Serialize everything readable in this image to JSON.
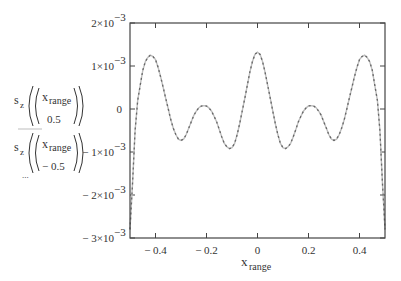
{
  "chart_data": {
    "type": "line",
    "title": "",
    "xlabel": "x",
    "xlabel_sub": "range",
    "ylabel": "",
    "xlim": [
      -0.5,
      0.5
    ],
    "ylim": [
      -0.003,
      0.002
    ],
    "grid": false,
    "x_ticks": [
      -0.4,
      -0.2,
      0,
      0.2,
      0.4
    ],
    "x_tick_labels": [
      "− 0.4",
      "− 0.2",
      "0",
      "0.2",
      "0.4"
    ],
    "y_ticks": [
      0.002,
      0.001,
      0,
      -0.001,
      -0.002,
      -0.003
    ],
    "y_tick_labels": [
      {
        "mant": "2×10",
        "exp": "−3"
      },
      {
        "mant": "1×10",
        "exp": "−3"
      },
      {
        "mant": "0",
        "exp": ""
      },
      {
        "mant": "− 1×10",
        "exp": "−3"
      },
      {
        "mant": "− 2×10",
        "exp": "−3"
      },
      {
        "mant": "− 3×10",
        "exp": "−3"
      }
    ],
    "legend": {
      "placement": "left",
      "entries": [
        {
          "fn": "s",
          "fn_sub": "z",
          "arg_top": "x",
          "arg_top_sub": "range",
          "arg_bottom": "0.5",
          "style": "solid",
          "color": "#bdbdbd"
        },
        {
          "fn": "s",
          "fn_sub": "z",
          "arg_top": "x",
          "arg_top_sub": "range",
          "arg_bottom": "− 0.5",
          "style": "dashed",
          "color": "#666666"
        }
      ],
      "ellipsis": "..."
    },
    "series": [
      {
        "name": "s_z(x_range, 0.5)",
        "style": "solid",
        "color": "#bdbdbd",
        "x": [
          -0.5,
          -0.49,
          -0.48,
          -0.47,
          -0.46,
          -0.45,
          -0.44,
          -0.43,
          -0.42,
          -0.41,
          -0.4,
          -0.39,
          -0.38,
          -0.37,
          -0.36,
          -0.35,
          -0.34,
          -0.33,
          -0.32,
          -0.31,
          -0.3,
          -0.29,
          -0.28,
          -0.27,
          -0.26,
          -0.25,
          -0.24,
          -0.23,
          -0.22,
          -0.21,
          -0.2,
          -0.19,
          -0.18,
          -0.17,
          -0.16,
          -0.15,
          -0.14,
          -0.13,
          -0.12,
          -0.11,
          -0.1,
          -0.09,
          -0.08,
          -0.07,
          -0.06,
          -0.05,
          -0.04,
          -0.03,
          -0.02,
          -0.01,
          0,
          0.01,
          0.02,
          0.03,
          0.04,
          0.05,
          0.06,
          0.07,
          0.08,
          0.09,
          0.1,
          0.11,
          0.12,
          0.13,
          0.14,
          0.15,
          0.16,
          0.17,
          0.18,
          0.19,
          0.2,
          0.21,
          0.22,
          0.23,
          0.24,
          0.25,
          0.26,
          0.27,
          0.28,
          0.29,
          0.3,
          0.31,
          0.32,
          0.33,
          0.34,
          0.35,
          0.36,
          0.37,
          0.38,
          0.39,
          0.4,
          0.41,
          0.42,
          0.43,
          0.44,
          0.45,
          0.46,
          0.47,
          0.48,
          0.49,
          0.5
        ],
        "y": [
          -0.0028,
          -0.0017,
          -0.0005,
          0.0002,
          0.00055,
          0.0009,
          0.0011,
          0.0012,
          0.00125,
          0.00122,
          0.00115,
          0.00097,
          0.00075,
          0.0005,
          0.00025,
          0.0,
          -0.00025,
          -0.00045,
          -0.0006,
          -0.0007,
          -0.00073,
          -0.0007,
          -0.0006,
          -0.00045,
          -0.0003,
          -0.00015,
          -5e-05,
          3e-05,
          7e-05,
          8e-05,
          7e-05,
          2e-05,
          -5e-05,
          -0.00017,
          -0.0003,
          -0.00048,
          -0.00065,
          -0.0008,
          -0.00088,
          -0.00092,
          -0.0009,
          -0.0008,
          -0.0006,
          -0.00035,
          -5e-05,
          0.00025,
          0.00055,
          0.00085,
          0.0011,
          0.00127,
          0.00132,
          0.00127,
          0.0011,
          0.00085,
          0.00055,
          0.00025,
          -5e-05,
          -0.00035,
          -0.0006,
          -0.0008,
          -0.0009,
          -0.00092,
          -0.00088,
          -0.0008,
          -0.00065,
          -0.00048,
          -0.0003,
          -0.00017,
          -5e-05,
          2e-05,
          7e-05,
          8e-05,
          7e-05,
          3e-05,
          -5e-05,
          -0.00015,
          -0.0003,
          -0.00045,
          -0.0006,
          -0.0007,
          -0.00073,
          -0.0007,
          -0.0006,
          -0.00045,
          -0.00025,
          0.0,
          0.00025,
          0.0005,
          0.00075,
          0.00097,
          0.00115,
          0.00122,
          0.00125,
          0.0012,
          0.0011,
          0.0009,
          0.00055,
          0.0002,
          -0.0005,
          -0.0017,
          -0.0028
        ]
      },
      {
        "name": "s_z(x_range, -0.5)",
        "style": "dashed",
        "color": "#666666",
        "x": [
          -0.5,
          -0.49,
          -0.48,
          -0.47,
          -0.46,
          -0.45,
          -0.44,
          -0.43,
          -0.42,
          -0.41,
          -0.4,
          -0.39,
          -0.38,
          -0.37,
          -0.36,
          -0.35,
          -0.34,
          -0.33,
          -0.32,
          -0.31,
          -0.3,
          -0.29,
          -0.28,
          -0.27,
          -0.26,
          -0.25,
          -0.24,
          -0.23,
          -0.22,
          -0.21,
          -0.2,
          -0.19,
          -0.18,
          -0.17,
          -0.16,
          -0.15,
          -0.14,
          -0.13,
          -0.12,
          -0.11,
          -0.1,
          -0.09,
          -0.08,
          -0.07,
          -0.06,
          -0.05,
          -0.04,
          -0.03,
          -0.02,
          -0.01,
          0,
          0.01,
          0.02,
          0.03,
          0.04,
          0.05,
          0.06,
          0.07,
          0.08,
          0.09,
          0.1,
          0.11,
          0.12,
          0.13,
          0.14,
          0.15,
          0.16,
          0.17,
          0.18,
          0.19,
          0.2,
          0.21,
          0.22,
          0.23,
          0.24,
          0.25,
          0.26,
          0.27,
          0.28,
          0.29,
          0.3,
          0.31,
          0.32,
          0.33,
          0.34,
          0.35,
          0.36,
          0.37,
          0.38,
          0.39,
          0.4,
          0.41,
          0.42,
          0.43,
          0.44,
          0.45,
          0.46,
          0.47,
          0.48,
          0.49,
          0.5
        ],
        "y": [
          -0.0028,
          -0.0017,
          -0.0005,
          0.0002,
          0.00055,
          0.0009,
          0.0011,
          0.0012,
          0.00125,
          0.00122,
          0.00115,
          0.00097,
          0.00075,
          0.0005,
          0.00025,
          0.0,
          -0.00025,
          -0.00045,
          -0.0006,
          -0.0007,
          -0.00073,
          -0.0007,
          -0.0006,
          -0.00045,
          -0.0003,
          -0.00015,
          -5e-05,
          3e-05,
          7e-05,
          8e-05,
          7e-05,
          2e-05,
          -5e-05,
          -0.00017,
          -0.0003,
          -0.00048,
          -0.00065,
          -0.0008,
          -0.00088,
          -0.00092,
          -0.0009,
          -0.0008,
          -0.0006,
          -0.00035,
          -5e-05,
          0.00025,
          0.00055,
          0.00085,
          0.0011,
          0.00127,
          0.00132,
          0.00127,
          0.0011,
          0.00085,
          0.00055,
          0.00025,
          -5e-05,
          -0.00035,
          -0.0006,
          -0.0008,
          -0.0009,
          -0.00092,
          -0.00088,
          -0.0008,
          -0.00065,
          -0.00048,
          -0.0003,
          -0.00017,
          -5e-05,
          2e-05,
          7e-05,
          8e-05,
          7e-05,
          3e-05,
          -5e-05,
          -0.00015,
          -0.0003,
          -0.00045,
          -0.0006,
          -0.0007,
          -0.00073,
          -0.0007,
          -0.0006,
          -0.00045,
          -0.00025,
          0.0,
          0.00025,
          0.0005,
          0.00075,
          0.00097,
          0.00115,
          0.00122,
          0.00125,
          0.0012,
          0.0011,
          0.0009,
          0.00055,
          0.0002,
          -0.0005,
          -0.0017,
          -0.0028
        ]
      }
    ]
  }
}
